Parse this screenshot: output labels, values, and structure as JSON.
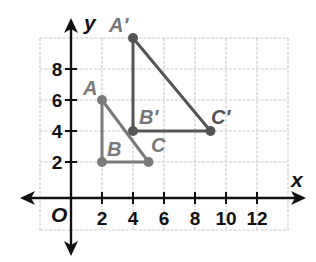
{
  "axes": {
    "x_name": "x",
    "y_name": "y",
    "origin_label": "O",
    "x_ticks": [
      "2",
      "4",
      "6",
      "8",
      "10",
      "12"
    ],
    "y_ticks": [
      "2",
      "4",
      "6",
      "8"
    ]
  },
  "grid": {
    "x_min": -2,
    "x_max": 14,
    "y_min": -2,
    "y_max": 10,
    "step": 2
  },
  "colors": {
    "grid": "#cccccc",
    "axis": "#111111",
    "original": "#7a7a7a",
    "image": "#555555"
  },
  "triangles": {
    "original": {
      "points": [
        {
          "name": "A",
          "x": 2,
          "y": 6
        },
        {
          "name": "B",
          "x": 2,
          "y": 2
        },
        {
          "name": "C",
          "x": 5,
          "y": 2
        }
      ]
    },
    "image": {
      "points": [
        {
          "name": "A′",
          "x": 4,
          "y": 10
        },
        {
          "name": "B′",
          "x": 4,
          "y": 4
        },
        {
          "name": "C′",
          "x": 9,
          "y": 4
        }
      ]
    }
  },
  "labels": {
    "A": "A",
    "B": "B",
    "C": "C",
    "A_prime": "A′",
    "B_prime": "B′",
    "C_prime": "C′"
  }
}
